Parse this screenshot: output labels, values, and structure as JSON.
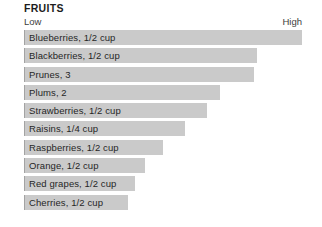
{
  "header": {
    "title": "FRUITS"
  },
  "axis": {
    "low_label": "Low",
    "high_label": "High"
  },
  "colors": {
    "bar_fill": "#cacaca",
    "bar_edge": "#a3a3a3",
    "text": "#262626",
    "background": "#ffffff"
  },
  "chart_data": {
    "type": "bar",
    "orientation": "horizontal",
    "title": "FRUITS",
    "xlabel": "",
    "ylabel": "",
    "xlim": [
      0,
      100
    ],
    "grid": false,
    "legend": null,
    "axis_tick_labels": [
      "Low",
      "High"
    ],
    "categories": [
      "Blueberries, 1/2 cup",
      "Blackberries, 1/2 cup",
      "Prunes, 3",
      "Plums, 2",
      "Strawberries, 1/2 cup",
      "Raisins, 1/4 cup",
      "Raspberries, 1/2 cup",
      "Orange, 1/2 cup",
      "Red grapes, 1/2 cup",
      "Cherries, 1/2 cup"
    ],
    "values": [
      100,
      83.8,
      82.7,
      70.5,
      65.8,
      57.9,
      50.0,
      43.5,
      39.9,
      37.4
    ],
    "bars": [
      {
        "label": "Blueberries, 1/2 cup",
        "value": 100,
        "width_pct": 100
      },
      {
        "label": "Blackberries, 1/2 cup",
        "value": 83.8,
        "width_pct": 83.8
      },
      {
        "label": "Prunes, 3",
        "value": 82.7,
        "width_pct": 82.7
      },
      {
        "label": "Plums, 2",
        "value": 70.5,
        "width_pct": 70.5
      },
      {
        "label": "Strawberries, 1/2 cup",
        "value": 65.8,
        "width_pct": 65.8
      },
      {
        "label": "Raisins, 1/4 cup",
        "value": 57.9,
        "width_pct": 57.9
      },
      {
        "label": "Raspberries, 1/2 cup",
        "value": 50.0,
        "width_pct": 50.0
      },
      {
        "label": "Orange, 1/2 cup",
        "value": 43.5,
        "width_pct": 43.5
      },
      {
        "label": "Red grapes, 1/2 cup",
        "value": 39.9,
        "width_pct": 39.9
      },
      {
        "label": "Cherries, 1/2 cup",
        "value": 37.4,
        "width_pct": 37.4
      }
    ]
  }
}
